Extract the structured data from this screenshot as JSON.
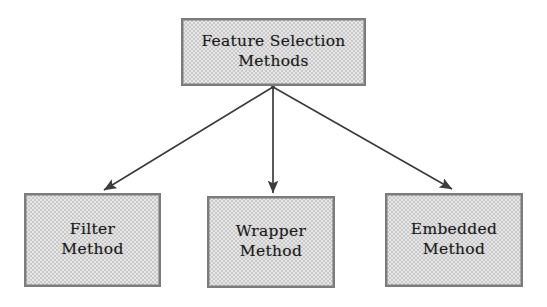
{
  "diagram": {
    "title": "Feature Selection Methods",
    "background_color": "#ffffff",
    "node_fill_color": "#c9c9c9",
    "node_border_color": "#7c7c7c",
    "connector_color": "#3c3c3c",
    "root": {
      "id": "feature-selection-methods",
      "label": "Feature Selection\nMethods"
    },
    "children": [
      {
        "id": "filter-method",
        "label": "Filter\nMethod"
      },
      {
        "id": "wrapper-method",
        "label": "Wrapper\nMethod"
      },
      {
        "id": "embedded-method",
        "label": "Embedded\nMethod"
      }
    ],
    "connectors": [
      {
        "id": "root-to-filter",
        "from": "feature-selection-methods",
        "to": "filter-method",
        "style": "arrow"
      },
      {
        "id": "root-to-wrapper",
        "from": "feature-selection-methods",
        "to": "wrapper-method",
        "style": "arrow"
      },
      {
        "id": "root-to-embedded",
        "from": "feature-selection-methods",
        "to": "embedded-method",
        "style": "arrow"
      }
    ]
  }
}
